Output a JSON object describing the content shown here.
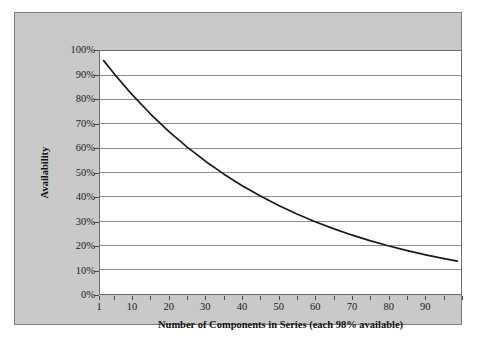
{
  "chart_data": {
    "type": "line",
    "title": "",
    "subtitle": "",
    "xlabel": "Number of Components in Series (each 98% available)",
    "ylabel": "Availability",
    "xlim": [
      1,
      100
    ],
    "ylim": [
      0,
      1.0
    ],
    "grid": true,
    "grid_axis": "y",
    "legend": false,
    "legend_position": "none",
    "x_tick_labels": [
      "1",
      "10",
      "20",
      "30",
      "40",
      "50",
      "60",
      "70",
      "80",
      "90"
    ],
    "x_tick_values": [
      1,
      10,
      20,
      30,
      40,
      50,
      60,
      70,
      80,
      90
    ],
    "x_minor_tick_values": [
      1,
      5,
      10,
      15,
      20,
      25,
      30,
      35,
      40,
      45,
      50,
      55,
      60,
      65,
      70,
      75,
      80,
      85,
      90,
      95,
      100
    ],
    "y_tick_labels": [
      "0%",
      "10%",
      "20%",
      "30%",
      "40%",
      "50%",
      "60%",
      "70%",
      "80%",
      "90%",
      "100%"
    ],
    "y_tick_values": [
      0,
      0.1,
      0.2,
      0.3,
      0.4,
      0.5,
      0.6,
      0.7,
      0.8,
      0.9,
      1.0
    ],
    "series": [
      {
        "name": "Availability = 0.98^n",
        "color": "#1a1a1a",
        "x": [
          2,
          5,
          10,
          15,
          20,
          25,
          30,
          35,
          40,
          45,
          50,
          55,
          60,
          65,
          70,
          75,
          80,
          85,
          90,
          95,
          99
        ],
        "values": [
          0.9604,
          0.9039,
          0.8171,
          0.7386,
          0.6676,
          0.6035,
          0.5455,
          0.4931,
          0.4457,
          0.4029,
          0.3642,
          0.3292,
          0.2976,
          0.269,
          0.2431,
          0.2198,
          0.1987,
          0.1796,
          0.1623,
          0.1467,
          0.1353
        ]
      }
    ],
    "annotations": []
  },
  "colors": {
    "panel_background": "#c9c9c9",
    "plot_background": "#ffffff",
    "gridline": "#8c8c8c",
    "axis_line": "#6d6d6d",
    "curve": "#1a1a1a",
    "text": "#111111"
  }
}
